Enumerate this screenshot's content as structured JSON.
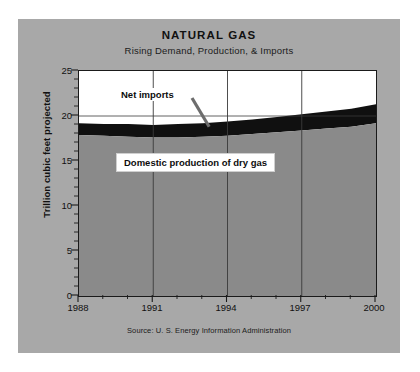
{
  "chart_data": {
    "type": "area",
    "title": "NATURAL GAS",
    "subtitle": "Rising Demand, Production, & Imports",
    "xlabel": "",
    "ylabel": "Trillion cubic feet projected",
    "source": "Source: U. S. Energy Information Administration",
    "stacked": true,
    "grid": true,
    "legend_position": "inline-annotations",
    "xlim": [
      1988,
      2000
    ],
    "ylim": [
      0,
      25
    ],
    "x": [
      1988,
      1989,
      1990,
      1991,
      1992,
      1993,
      1994,
      1995,
      1996,
      1997,
      1998,
      1999,
      2000
    ],
    "xticks": [
      1988,
      1991,
      1994,
      1997,
      2000
    ],
    "xtick_labels": [
      "1988",
      "1991",
      "1994",
      "1997",
      "2000"
    ],
    "xminor_ticks": [
      1989,
      1990,
      1992,
      1993,
      1995,
      1996,
      1998,
      1999
    ],
    "yticks": [
      0,
      5,
      10,
      15,
      20,
      25
    ],
    "ytick_labels": [
      "0",
      "5",
      "10",
      "15",
      "20",
      "25"
    ],
    "yminor_step": 1,
    "series": [
      {
        "name": "Domestic production of dry gas",
        "color": "#8a8a8a",
        "values": [
          17.9,
          17.8,
          17.7,
          17.6,
          17.6,
          17.7,
          17.8,
          18.0,
          18.2,
          18.4,
          18.6,
          18.8,
          19.2
        ]
      },
      {
        "name": "Net imports",
        "color": "#101010",
        "values": [
          1.3,
          1.3,
          1.4,
          1.4,
          1.5,
          1.5,
          1.6,
          1.6,
          1.7,
          1.8,
          1.9,
          2.0,
          2.1
        ]
      }
    ],
    "totals": [
      19.2,
      19.1,
      19.1,
      19.0,
      19.1,
      19.2,
      19.4,
      19.6,
      19.9,
      20.2,
      20.5,
      20.8,
      21.3
    ],
    "annotations": [
      {
        "name": "net-imports",
        "text": "Net imports",
        "points_to_year": 1993.3,
        "points_to_value": 18.7
      },
      {
        "name": "domestic-production",
        "text": "Domestic production of dry gas",
        "boxed": true
      }
    ]
  },
  "colors": {
    "background": "#ffffff",
    "card": "#a8a8a8",
    "plot_background": "#ffffff",
    "axis": "#1a1a1a",
    "grid": "#3a3a3a",
    "net_imports": "#101010",
    "domestic_production": "#8a8a8a",
    "text": "#111111",
    "leader_line": "#6d6d6d"
  }
}
